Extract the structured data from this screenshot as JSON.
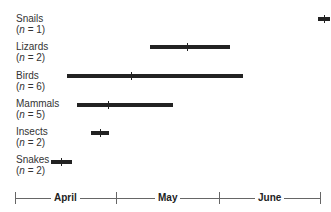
{
  "chart_data": {
    "type": "bar",
    "subtype": "range (timeline) with median tick",
    "title": "",
    "xlabel": "",
    "ylabel": "",
    "x_axis": {
      "segments": [
        "April",
        "May",
        "June"
      ],
      "unit": "day of season (0 = April 1)",
      "range": [
        0,
        91
      ]
    },
    "categories": [
      "Snails",
      "Lizards",
      "Birds",
      "Mammals",
      "Insects",
      "Snakes"
    ],
    "sample_sizes": [
      "n = 1",
      "n = 2",
      "n = 6",
      "n = 5",
      "n = 2",
      "n = 2"
    ],
    "series": [
      {
        "name": "start",
        "values": [
          90,
          40,
          15,
          18,
          22,
          11
        ]
      },
      {
        "name": "median",
        "values": [
          92,
          51,
          34,
          28,
          25,
          14
        ]
      },
      {
        "name": "end",
        "values": [
          94,
          64,
          68,
          47,
          28,
          17
        ]
      }
    ]
  },
  "rows": [
    {
      "name": "Snails",
      "n": "(n = 1)",
      "label_top": 13,
      "bar_top": 17,
      "x1": 318,
      "x2": 330,
      "tick": 324
    },
    {
      "name": "Lizards",
      "n": "(n = 2)",
      "label_top": 41,
      "bar_top": 45,
      "x1": 150,
      "x2": 230,
      "tick": 187
    },
    {
      "name": "Birds",
      "n": "(n = 6)",
      "label_top": 70,
      "bar_top": 74,
      "x1": 67,
      "x2": 243,
      "tick": 131
    },
    {
      "name": "Mammals",
      "n": "(n = 5)",
      "label_top": 98,
      "bar_top": 103,
      "x1": 77,
      "x2": 173,
      "tick": 108
    },
    {
      "name": "Insects",
      "n": "(n = 2)",
      "label_top": 126,
      "bar_top": 131,
      "x1": 91,
      "x2": 109,
      "tick": 100
    },
    {
      "name": "Snakes",
      "n": "(n = 2)",
      "label_top": 154,
      "bar_top": 160,
      "x1": 51,
      "x2": 72,
      "tick": 61
    }
  ],
  "axis": {
    "months": [
      {
        "label": "April",
        "x1": 15,
        "x2": 116
      },
      {
        "label": "May",
        "x1": 116,
        "x2": 219
      },
      {
        "label": "June",
        "x1": 219,
        "x2": 320
      }
    ]
  }
}
